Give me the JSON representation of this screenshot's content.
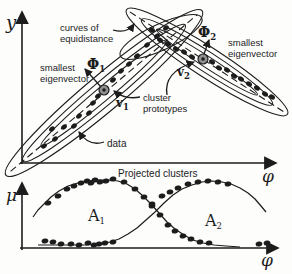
{
  "palette": {
    "ink": "#1c1c1c",
    "paper": "#fdfdfc",
    "prototype_fill": "#909090"
  },
  "top_plot": {
    "y_axis_label": "y",
    "x_axis_label": "φ",
    "annotations": {
      "curves_of_equidistance": {
        "line1": "curves of",
        "line2": "equidistance"
      },
      "smallest_eigenvector_left": {
        "line1": "smallest",
        "line2": "eigenvector"
      },
      "smallest_eigenvector_right": {
        "line1": "smallest",
        "line2": "eigenvector"
      },
      "phi1": {
        "base": "Φ",
        "sub": "1"
      },
      "phi2": {
        "base": "Φ",
        "sub": "2"
      },
      "v1": {
        "base": "v",
        "sub": "1"
      },
      "v2": {
        "base": "v",
        "sub": "2"
      },
      "cluster_prototypes": {
        "line1": "cluster",
        "line2": "prototypes"
      },
      "data_label": "data"
    }
  },
  "bottom_plot": {
    "title": "Projected clusters",
    "y_axis_label": "μ",
    "x_axis_label": "φ",
    "a1": {
      "base": "A",
      "sub": "1"
    },
    "a2": {
      "base": "A",
      "sub": "2"
    }
  },
  "figure": {
    "ink": "#1c1c1c",
    "prototype_fill": "#909090",
    "top": {
      "cluster1": {
        "cx": 104,
        "cy": 93,
        "angle": -40,
        "ellipses": [
          [
            128,
            18
          ],
          [
            106,
            12
          ],
          [
            82,
            7
          ]
        ],
        "axis_half": 122,
        "dots": [
          [
            44,
            146
          ],
          [
            55,
            139
          ],
          [
            52,
            129
          ],
          [
            64,
            127
          ],
          [
            74,
            126
          ],
          [
            79,
            116
          ],
          [
            89,
            113
          ],
          [
            93,
            103
          ],
          [
            98,
            96
          ],
          [
            113,
            80
          ],
          [
            121,
            71
          ],
          [
            129,
            64
          ],
          [
            137,
            56
          ],
          [
            147,
            45
          ],
          [
            157,
            36
          ],
          [
            166,
            28
          ]
        ],
        "prototype": [
          104,
          90
        ]
      },
      "cluster2": {
        "cx": 207,
        "cy": 62,
        "angle": 33,
        "ellipses": [
          [
            96,
            15
          ],
          [
            78,
            10
          ],
          [
            60,
            5.5
          ]
        ],
        "axis_half": 92,
        "dots": [
          [
            152,
            30
          ],
          [
            160,
            40
          ],
          [
            168,
            44
          ],
          [
            176,
            49
          ],
          [
            184,
            52
          ],
          [
            192,
            57
          ],
          [
            212,
            62
          ],
          [
            219,
            68
          ],
          [
            227,
            70
          ],
          [
            234,
            76
          ],
          [
            241,
            79
          ],
          [
            249,
            84
          ],
          [
            257,
            88
          ],
          [
            265,
            94
          ],
          [
            272,
            97
          ]
        ],
        "prototype": [
          203,
          59
        ]
      },
      "equidistance_ellipse": {
        "cx": 161,
        "cy": 37,
        "angle": -25,
        "rx": 45,
        "ry": 13
      }
    },
    "bottom": {
      "a1_curve": [
        [
          33,
          217
        ],
        [
          38,
          210
        ],
        [
          44,
          204
        ],
        [
          51,
          197
        ],
        [
          59,
          191
        ],
        [
          68,
          186
        ],
        [
          78,
          183
        ],
        [
          88,
          181
        ],
        [
          98,
          180
        ],
        [
          108,
          180
        ],
        [
          118,
          181
        ],
        [
          127,
          184
        ],
        [
          135,
          189
        ],
        [
          143,
          196
        ],
        [
          151,
          204
        ],
        [
          159,
          213
        ],
        [
          167,
          222
        ],
        [
          175,
          229
        ],
        [
          184,
          235
        ],
        [
          193,
          240
        ],
        [
          203,
          243
        ],
        [
          214,
          245
        ],
        [
          226,
          246
        ],
        [
          240,
          247
        ]
      ],
      "a2_curve": [
        [
          38,
          245
        ],
        [
          55,
          245
        ],
        [
          70,
          245
        ],
        [
          85,
          245
        ],
        [
          100,
          244
        ],
        [
          110,
          242
        ],
        [
          119,
          239
        ],
        [
          128,
          234
        ],
        [
          137,
          228
        ],
        [
          146,
          220
        ],
        [
          155,
          212
        ],
        [
          164,
          203
        ],
        [
          173,
          195
        ],
        [
          182,
          189
        ],
        [
          192,
          185
        ],
        [
          202,
          182
        ],
        [
          212,
          181
        ],
        [
          222,
          182
        ],
        [
          231,
          184
        ],
        [
          240,
          188
        ],
        [
          248,
          193
        ],
        [
          255,
          199
        ],
        [
          261,
          206
        ],
        [
          266,
          212
        ]
      ],
      "a1_dots": [
        [
          48,
          203
        ],
        [
          58,
          196
        ],
        [
          67,
          189
        ],
        [
          74,
          186
        ],
        [
          81,
          183
        ],
        [
          87,
          181
        ],
        [
          91,
          183
        ],
        [
          95,
          180
        ],
        [
          100,
          182
        ],
        [
          106,
          181
        ],
        [
          113,
          179
        ],
        [
          124,
          182
        ],
        [
          135,
          189
        ],
        [
          144,
          197
        ],
        [
          152,
          206
        ],
        [
          160,
          215
        ],
        [
          168,
          225
        ],
        [
          175,
          231
        ],
        [
          183,
          236
        ],
        [
          191,
          239
        ],
        [
          200,
          242
        ],
        [
          209,
          243
        ],
        [
          259,
          244
        ],
        [
          267,
          243
        ]
      ],
      "a2_dots": [
        [
          45,
          241
        ],
        [
          53,
          242
        ],
        [
          61,
          244
        ],
        [
          71,
          244
        ],
        [
          79,
          245
        ],
        [
          88,
          243
        ],
        [
          94,
          245
        ],
        [
          99,
          244
        ],
        [
          105,
          243
        ],
        [
          113,
          242
        ],
        [
          152,
          204
        ],
        [
          162,
          196
        ],
        [
          170,
          192
        ],
        [
          178,
          188
        ],
        [
          188,
          184
        ],
        [
          198,
          182
        ],
        [
          208,
          181
        ],
        [
          218,
          182
        ],
        [
          228,
          184
        ]
      ]
    }
  }
}
